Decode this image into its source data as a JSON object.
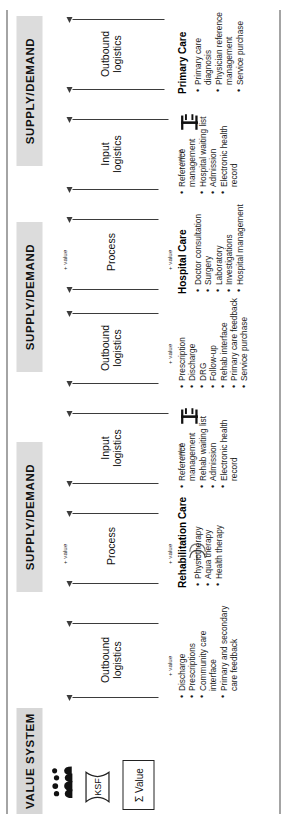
{
  "figure": {
    "orientation": "rotated-90",
    "colors": {
      "band_bg": "#DCDCDC",
      "line": "#3B3B3B",
      "text": "#1A1A1A"
    }
  },
  "bands": [
    {
      "id": "band-1",
      "label": "SUPPLY/DEMAND"
    },
    {
      "id": "band-2",
      "label": "SUPPLY/DEMAND"
    },
    {
      "id": "band-3",
      "label": "SUPPLY/DEMAND"
    },
    {
      "id": "band-4",
      "label": "VALUE SYSTEM"
    }
  ],
  "stages": [
    {
      "id": "stage-1",
      "label": "Outbound\nlogistics"
    },
    {
      "id": "stage-2",
      "label": "Input\nlogistics"
    },
    {
      "id": "stage-3",
      "label": "Process"
    },
    {
      "id": "stage-4",
      "label": "Outbound\nlogistics"
    },
    {
      "id": "stage-5",
      "label": "Input\nlogistics"
    },
    {
      "id": "stage-6",
      "label": "Process"
    },
    {
      "id": "stage-7",
      "label": "Outbound\nlogistics"
    }
  ],
  "value_markers": [
    {
      "id": "plus-value-1",
      "label": "+ value"
    },
    {
      "id": "plus-value-2",
      "label": "+ value"
    },
    {
      "id": "plus-value-3",
      "label": "+ value"
    },
    {
      "id": "plus-value-4",
      "label": "+ value"
    },
    {
      "id": "plus-value-5",
      "label": "+ value"
    },
    {
      "id": "plus-value-6",
      "label": "+ value"
    },
    {
      "id": "plus-value-7",
      "label": "+ value"
    },
    {
      "id": "plus-value-8",
      "label": "+ value"
    }
  ],
  "care_blocks": [
    {
      "id": "primary-care",
      "title": "Primary Care",
      "inputs": [
        "Primary care diagnosis",
        "Physician reference management",
        "Service purchase"
      ],
      "outputs": [
        "Reference management",
        "Hospital waiting list",
        "Admission",
        "Electronic health record"
      ]
    },
    {
      "id": "hospital-care",
      "title": "Hospital Care",
      "inputs": [
        "Doctor consultation",
        "Surgery",
        "Laboratory",
        "Investigations",
        "Hospital management"
      ],
      "outputs": [
        "Prescription",
        "Discharge",
        "DRG",
        "Follow-up",
        "Rehab interface",
        "Primary care feedback",
        "Service purchase"
      ]
    },
    {
      "id": "rehabilitation-care",
      "title": "Rehabilitation Care",
      "inputs": [
        "Physiotherapy",
        "Aqua therapy",
        "Health therapy"
      ],
      "outputs": [
        "Reference management",
        "Rehab waiting list",
        "Admission",
        "Electronic health record"
      ]
    },
    {
      "id": "rehabilitation-care-outputs",
      "title": "",
      "outputs": [
        "Discharge",
        "Prescriptions",
        "Community care interface",
        "Primary and secondary care feedback"
      ]
    }
  ],
  "value_system": {
    "ksf_label": "KSF",
    "sum_value_label": "Σ Value",
    "people_icon": "people-icon"
  }
}
